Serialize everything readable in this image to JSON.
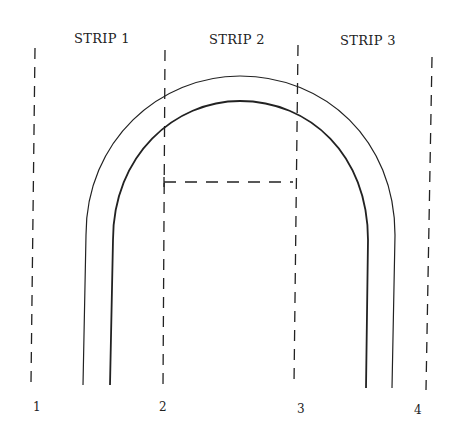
{
  "diagram": {
    "strip_labels": [
      "STRIP 1",
      "STRIP 2",
      "STRIP 3"
    ],
    "line_labels": [
      "1",
      "2",
      "3",
      "4"
    ],
    "colors": {
      "ink": "#222222",
      "background": "#ffffff"
    }
  }
}
